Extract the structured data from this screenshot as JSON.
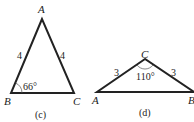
{
  "figures": [
    {
      "caption": "(c)",
      "vertices": {
        "A": "A",
        "B": "B",
        "C": "C"
      },
      "sides": {
        "AB": "4",
        "AC": "4"
      },
      "angle": {
        "at": "B",
        "label": "66°"
      }
    },
    {
      "caption": "(d)",
      "vertices": {
        "A": "A",
        "B": "B",
        "C": "C"
      },
      "sides": {
        "CA": "3",
        "CB": "3"
      },
      "angle": {
        "at": "C",
        "label": "110°"
      }
    }
  ]
}
